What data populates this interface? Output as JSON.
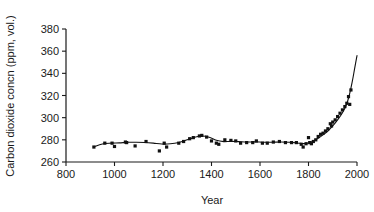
{
  "figure": {
    "background_color": "#ffffff",
    "ink_color": "#111111"
  },
  "chart_data": {
    "type": "scatter",
    "title": "",
    "subtitle": "",
    "xlabel": "Year",
    "ylabel": "Carbon dioxide concn (ppm, vol.)",
    "xlim": [
      800,
      2000
    ],
    "ylim": [
      260,
      380
    ],
    "xticks": [
      800,
      1000,
      1200,
      1400,
      1600,
      1800,
      2000
    ],
    "yticks": [
      260,
      280,
      300,
      320,
      340,
      360,
      380
    ],
    "xtick_labels": [
      "800",
      "1000",
      "1200",
      "1400",
      "1600",
      "1800",
      "2000"
    ],
    "ytick_labels": [
      "260",
      "280",
      "300",
      "320",
      "340",
      "360",
      "380"
    ],
    "grid": false,
    "legend": null,
    "legend_position": "none",
    "marker": "square",
    "series": [
      {
        "name": "Ice-core CO2 measurements",
        "type": "scatter",
        "points": [
          [
            915,
            273.5
          ],
          [
            960,
            277.0
          ],
          [
            990,
            277.0
          ],
          [
            1000,
            274.0
          ],
          [
            1045,
            278.0
          ],
          [
            1050,
            277.5
          ],
          [
            1085,
            274.5
          ],
          [
            1130,
            278.5
          ],
          [
            1185,
            270.0
          ],
          [
            1205,
            277.0
          ],
          [
            1215,
            273.5
          ],
          [
            1265,
            277.0
          ],
          [
            1285,
            278.5
          ],
          [
            1310,
            281.0
          ],
          [
            1325,
            282.0
          ],
          [
            1350,
            283.5
          ],
          [
            1360,
            284.0
          ],
          [
            1380,
            282.5
          ],
          [
            1400,
            279.0
          ],
          [
            1420,
            277.0
          ],
          [
            1430,
            276.0
          ],
          [
            1455,
            280.0
          ],
          [
            1480,
            279.5
          ],
          [
            1500,
            279.0
          ],
          [
            1520,
            277.0
          ],
          [
            1545,
            277.5
          ],
          [
            1570,
            277.5
          ],
          [
            1585,
            279.0
          ],
          [
            1610,
            277.0
          ],
          [
            1630,
            277.0
          ],
          [
            1655,
            278.0
          ],
          [
            1680,
            278.5
          ],
          [
            1705,
            277.5
          ],
          [
            1730,
            277.5
          ],
          [
            1750,
            277.5
          ],
          [
            1770,
            276.0
          ],
          [
            1778,
            273.5
          ],
          [
            1790,
            276.5
          ],
          [
            1800,
            282.0
          ],
          [
            1805,
            277.5
          ],
          [
            1812,
            276.5
          ],
          [
            1820,
            278.5
          ],
          [
            1830,
            280.0
          ],
          [
            1840,
            283.0
          ],
          [
            1850,
            285.0
          ],
          [
            1860,
            286.0
          ],
          [
            1870,
            288.0
          ],
          [
            1880,
            290.0
          ],
          [
            1890,
            294.5
          ],
          [
            1895,
            292.5
          ],
          [
            1900,
            296.0
          ],
          [
            1910,
            298.0
          ],
          [
            1920,
            301.0
          ],
          [
            1930,
            304.0
          ],
          [
            1940,
            307.0
          ],
          [
            1950,
            310.0
          ],
          [
            1958,
            313.0
          ],
          [
            1965,
            319.0
          ],
          [
            1970,
            312.0
          ],
          [
            1975,
            325.0
          ]
        ]
      },
      {
        "name": "Smoothed trend",
        "type": "line",
        "points": [
          [
            915,
            273.8
          ],
          [
            950,
            276.2
          ],
          [
            985,
            277.0
          ],
          [
            1020,
            277.3
          ],
          [
            1055,
            277.8
          ],
          [
            1090,
            277.8
          ],
          [
            1125,
            277.6
          ],
          [
            1160,
            277.0
          ],
          [
            1195,
            276.2
          ],
          [
            1230,
            276.4
          ],
          [
            1265,
            277.6
          ],
          [
            1300,
            280.0
          ],
          [
            1335,
            282.6
          ],
          [
            1360,
            283.4
          ],
          [
            1390,
            282.4
          ],
          [
            1420,
            279.6
          ],
          [
            1450,
            278.4
          ],
          [
            1480,
            278.6
          ],
          [
            1510,
            278.4
          ],
          [
            1545,
            278.0
          ],
          [
            1580,
            278.2
          ],
          [
            1615,
            277.8
          ],
          [
            1650,
            277.8
          ],
          [
            1685,
            278.0
          ],
          [
            1720,
            277.8
          ],
          [
            1755,
            277.2
          ],
          [
            1780,
            276.6
          ],
          [
            1800,
            277.2
          ],
          [
            1820,
            279.0
          ],
          [
            1840,
            281.5
          ],
          [
            1860,
            284.5
          ],
          [
            1880,
            288.0
          ],
          [
            1900,
            292.5
          ],
          [
            1920,
            298.0
          ],
          [
            1940,
            304.5
          ],
          [
            1955,
            311.0
          ],
          [
            1968,
            320.0
          ],
          [
            1980,
            332.0
          ],
          [
            1990,
            344.0
          ],
          [
            2000,
            356.0
          ]
        ]
      }
    ]
  }
}
